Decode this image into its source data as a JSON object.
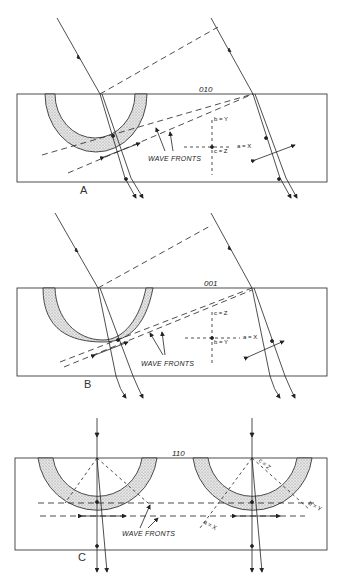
{
  "figure": {
    "panels": [
      {
        "id": "A",
        "label": "A",
        "face": "010",
        "wave_fronts_label": "WAVE FRONTS",
        "axes": {
          "vertical": "b = Y",
          "horizontal": "a = X",
          "center": "c = Z"
        }
      },
      {
        "id": "B",
        "label": "B",
        "face": "001",
        "wave_fronts_label": "WAVE FRONTS",
        "axes": {
          "vertical": "c = Z",
          "horizontal": "a = X",
          "center": "b = Y"
        }
      },
      {
        "id": "C",
        "label": "C",
        "face": "110",
        "wave_fronts_label": "WAVE FRONTS",
        "axes": {
          "diag1": "c = Z",
          "diag2": "b = Y",
          "diag3": "a = X"
        }
      }
    ],
    "colors": {
      "line": "#222222",
      "stipple": "#bdbdbd",
      "background": "#ffffff"
    }
  }
}
